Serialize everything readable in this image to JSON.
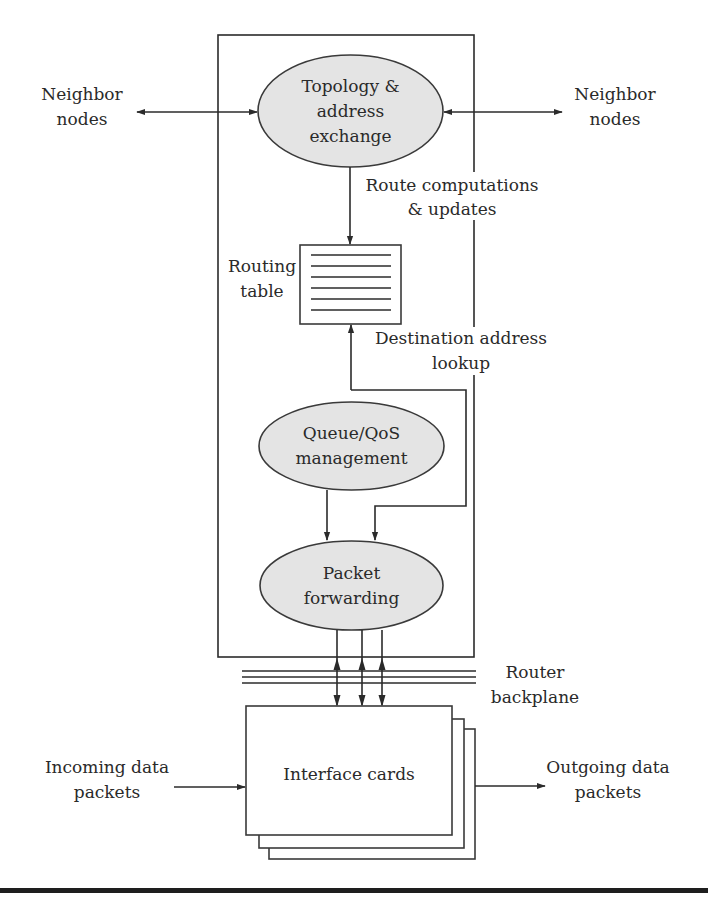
{
  "diagram": {
    "colors": {
      "ellipse_fill": "#e4e4e4",
      "stroke": "#2b2b2b",
      "text": "#2a2a2a",
      "background": "#ffffff"
    },
    "nodes": {
      "topology": {
        "line1": "Topology &",
        "line2": "address",
        "line3": "exchange"
      },
      "queue": {
        "line1": "Queue/QoS",
        "line2": "management"
      },
      "forwarding": {
        "line1": "Packet",
        "line2": "forwarding"
      },
      "routing_table": {
        "line1": "Routing",
        "line2": "table",
        "rows": 6
      },
      "interface_cards": {
        "label": "Interface cards",
        "stack_count": 3
      }
    },
    "labels": {
      "neighbor_left": {
        "line1": "Neighbor",
        "line2": "nodes"
      },
      "neighbor_right": {
        "line1": "Neighbor",
        "line2": "nodes"
      },
      "route_computations": {
        "line1": "Route computations",
        "line2": "& updates"
      },
      "destination_lookup": {
        "line1": "Destination address",
        "line2": "lookup"
      },
      "backplane": {
        "line1": "Router",
        "line2": "backplane"
      },
      "incoming": {
        "line1": "Incoming data",
        "line2": "packets"
      },
      "outgoing": {
        "line1": "Outgoing data",
        "line2": "packets"
      }
    }
  }
}
